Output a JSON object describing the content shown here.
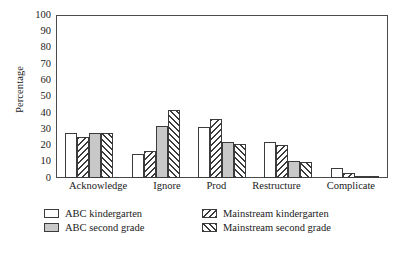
{
  "chart_data": {
    "type": "bar",
    "title": "",
    "xlabel": "",
    "ylabel": "Percentage",
    "ylim": [
      0,
      100
    ],
    "ytick_labels": [
      "100",
      "90",
      "80",
      "70",
      "60",
      "50",
      "40",
      "30",
      "20",
      "10",
      "0"
    ],
    "ytick_values": [
      100,
      90,
      80,
      70,
      60,
      50,
      40,
      30,
      20,
      10,
      0
    ],
    "grid": false,
    "legend_position": "bottom",
    "categories": [
      "Acknowledge",
      "Ignore",
      "Prod",
      "Restructure",
      "Complicate"
    ],
    "series": [
      {
        "name": "ABC kindergarten",
        "fill": "white",
        "values": [
          27.5,
          15,
          31,
          22,
          6
        ]
      },
      {
        "name": "Mainstream kindergarten",
        "fill": "backslash-hatch",
        "values": [
          25,
          16.5,
          36,
          20.5,
          3
        ]
      },
      {
        "name": "ABC second grade",
        "fill": "gray",
        "values": [
          27.5,
          32,
          22,
          10.5,
          0.7
        ]
      },
      {
        "name": "Mainstream second grade",
        "fill": "forward-slash-hatch",
        "values": [
          27.5,
          42,
          21,
          10,
          0.3
        ]
      }
    ]
  },
  "legend": {
    "entries": [
      {
        "label": "ABC kindergarten",
        "fill": "white"
      },
      {
        "label": "Mainstream kindergarten",
        "fill": "backslash-hatch"
      },
      {
        "label": "ABC second grade",
        "fill": "gray"
      },
      {
        "label": "Mainstream second grade",
        "fill": "forward-slash-hatch"
      }
    ]
  },
  "colors": {
    "axis": "#4a4a4a",
    "bar_outline": "#3b3b3b",
    "gray_fill": "#c8c8c8",
    "background": "#ffffff",
    "text": "#1a1a1a"
  }
}
